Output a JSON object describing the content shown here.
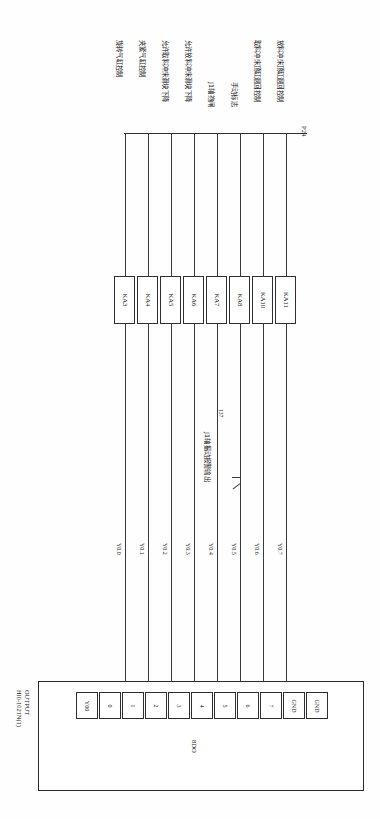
{
  "sheet": {
    "orientation": "rotated-90",
    "background": "#ffffff",
    "line_color": "#3a3a3a"
  },
  "module": {
    "title_line1": "OUTPUT",
    "title_line2": "HI0-1021N(1)",
    "bus_label": "8DO",
    "terminals": [
      {
        "label": "Y00"
      },
      {
        "label": "0"
      },
      {
        "label": "1"
      },
      {
        "label": "2"
      },
      {
        "label": "3"
      },
      {
        "label": "4"
      },
      {
        "label": "5"
      },
      {
        "label": "6"
      },
      {
        "label": "7"
      },
      {
        "label": "GND"
      },
      {
        "label": "GND"
      }
    ]
  },
  "power_rail": {
    "label": "P24"
  },
  "wires": [
    {
      "tag": "Y0.0",
      "relay": "KA3",
      "function": "旋转气缸控制"
    },
    {
      "tag": "Y0.1",
      "relay": "KA4",
      "function": "夹紧气缸控制"
    },
    {
      "tag": "Y0.2",
      "relay": "KA5",
      "function": "允许取料冲床滑块下降"
    },
    {
      "tag": "Y0.3",
      "relay": "KA6",
      "function": "允许放料冲床滑块下降"
    },
    {
      "tag": "Y0.4",
      "relay": "KA7",
      "function": "J1轴抱闸"
    },
    {
      "tag": "Y0.5",
      "relay": "KA8",
      "function": "手动标志"
    },
    {
      "tag": "Y0.6",
      "relay": "KA10",
      "function": "取料冲床顶缸退回控制"
    },
    {
      "tag": "Y0.7",
      "relay": "KA11",
      "function": "放料冲床顶缸退回控制"
    }
  ],
  "annotation": {
    "number": "137",
    "text": "J1轴振动报警输出"
  }
}
